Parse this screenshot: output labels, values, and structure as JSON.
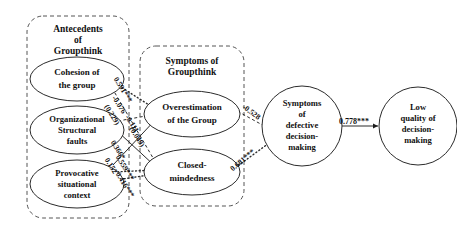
{
  "diagram": {
    "groups": [
      {
        "id": "antecedents",
        "title_lines": [
          "Antecedents",
          "of",
          "Groupthink"
        ]
      },
      {
        "id": "symptoms",
        "title_lines": [
          "Symptoms of",
          "Groupthink"
        ]
      }
    ],
    "nodes": [
      {
        "id": "cohesion",
        "lines": [
          "Cohesion of",
          "the group"
        ]
      },
      {
        "id": "organizational",
        "lines": [
          "Organizational",
          "Structural",
          "faults"
        ]
      },
      {
        "id": "provocative",
        "lines": [
          "Provocative",
          "situational",
          "context"
        ]
      },
      {
        "id": "overestimation",
        "lines": [
          "Overestimation",
          "of the Group"
        ]
      },
      {
        "id": "closed",
        "lines": [
          "Closed-",
          "mindedness"
        ]
      },
      {
        "id": "defective",
        "lines": [
          "Symptoms",
          "of",
          "defective",
          "decision-",
          "making"
        ]
      },
      {
        "id": "lowquality",
        "lines": [
          "Low",
          "quality of",
          "decision-",
          "making"
        ]
      }
    ],
    "paths": [
      {
        "id": "cohesion-overestimation",
        "from": "cohesion",
        "to": "overestimation",
        "label": "0.591***",
        "style": "dotted"
      },
      {
        "id": "cohesion-closed",
        "from": "cohesion",
        "to": "closed",
        "label": "-0.076",
        "label2": "(0.229)",
        "style": "dashed"
      },
      {
        "id": "organizational-overestimation",
        "from": "organizational",
        "to": "overestimation",
        "label": "-0.111",
        "label2": "(0.049)",
        "style": "dashed"
      },
      {
        "id": "organizational-closed",
        "from": "organizational",
        "to": "closed",
        "label": "0.366*",
        "style": "solid"
      },
      {
        "id": "provocative-overestimation",
        "from": "provocative",
        "to": "overestimation",
        "label": "0.152",
        "style": "solid"
      },
      {
        "id": "provocative-closed",
        "from": "provocative",
        "to": "closed",
        "label": "0.559***",
        "style": "dotted"
      },
      {
        "id": "provocative-closed-alt",
        "from": "provocative",
        "to": "closed",
        "label": "0.416***",
        "style": "dotted"
      },
      {
        "id": "overestimation-defective",
        "from": "overestimation",
        "to": "defective",
        "label": "-0.528",
        "style": "dashed"
      },
      {
        "id": "closed-defective",
        "from": "closed",
        "to": "defective",
        "label": "0.681***",
        "style": "dotted"
      },
      {
        "id": "defective-lowquality",
        "from": "defective",
        "to": "lowquality",
        "label": "0.778***",
        "style": "solid"
      }
    ]
  }
}
